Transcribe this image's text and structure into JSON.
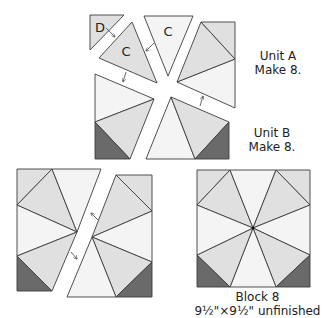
{
  "pieces": {
    "d_label": "D",
    "c_label_tilted": "C",
    "c_label_upright": "C"
  },
  "unit_a": {
    "title": "Unit A",
    "quantity": "Make 8."
  },
  "unit_b": {
    "title": "Unit B",
    "quantity": "Make 8."
  },
  "block": {
    "title": "Block 8",
    "size": "9½\"×9½\" unfinished"
  },
  "colors": {
    "light_fabric": "#f4f4f4",
    "medium_fabric": "#e0e0e0",
    "dark_fabric": "#6a6a6a",
    "outline": "#3c3c3c"
  }
}
